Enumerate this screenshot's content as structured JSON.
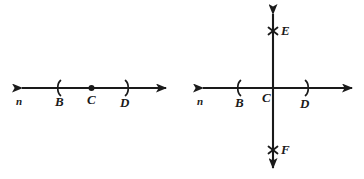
{
  "figure": {
    "stroke_color": "#1a1a1a",
    "background_color": "#ffffff",
    "diagrams": [
      {
        "id": "left-diagram",
        "description": "Line n with points B, C, D where C is a marked point",
        "line_name": "n",
        "points": [
          {
            "label": "B",
            "marker": "left-paren-tick"
          },
          {
            "label": "C",
            "marker": "filled-dot"
          },
          {
            "label": "D",
            "marker": "right-paren-tick"
          }
        ]
      },
      {
        "id": "right-diagram",
        "description": "Line n with points B, C, D crossed by a vertical line through C containing points E and F",
        "line_name": "n",
        "points": [
          {
            "label": "B",
            "marker": "left-paren-tick"
          },
          {
            "label": "C",
            "marker": "intersection"
          },
          {
            "label": "D",
            "marker": "right-paren-tick"
          },
          {
            "label": "E",
            "marker": "x-cross"
          },
          {
            "label": "F",
            "marker": "x-cross"
          }
        ]
      }
    ]
  },
  "labels": {
    "left": {
      "n": "n",
      "B": "B",
      "C": "C",
      "D": "D"
    },
    "right": {
      "n": "n",
      "B": "B",
      "C": "C",
      "D": "D",
      "E": "E",
      "F": "F"
    }
  }
}
